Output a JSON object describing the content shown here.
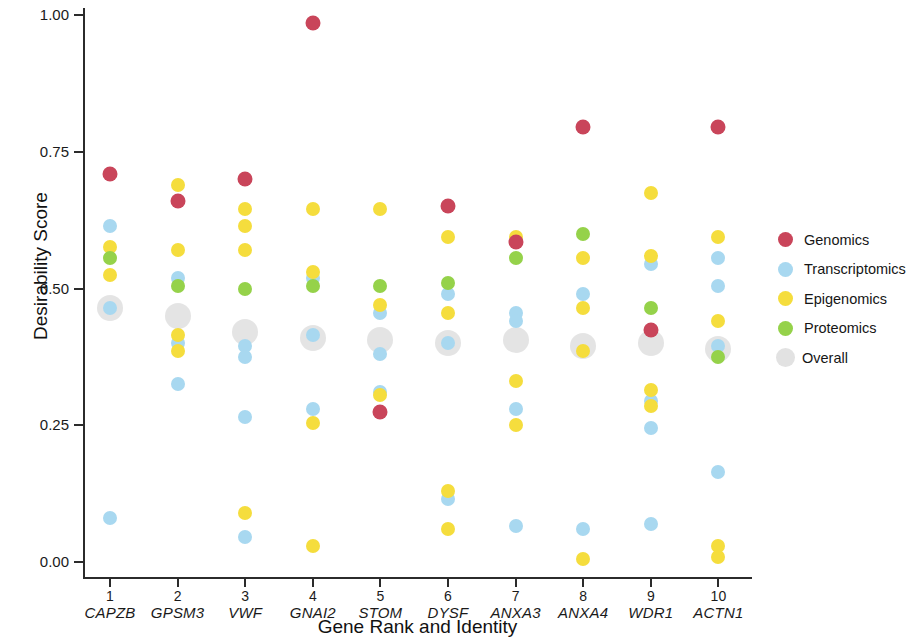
{
  "chart_data": {
    "type": "scatter",
    "title": "",
    "xlabel": "Gene Rank and Identity",
    "ylabel": "Desirability Score",
    "ylim": [
      0.0,
      1.0
    ],
    "ytick_labels": [
      "0.00",
      "0.25",
      "0.50",
      "0.75",
      "1.00"
    ],
    "ytick_values": [
      0.0,
      0.25,
      0.5,
      0.75,
      1.0
    ],
    "grid": false,
    "legend_position": "right",
    "categories": [
      {
        "rank": "1",
        "gene": "CAPZB"
      },
      {
        "rank": "2",
        "gene": "GPSM3"
      },
      {
        "rank": "3",
        "gene": "VWF"
      },
      {
        "rank": "4",
        "gene": "GNAI2"
      },
      {
        "rank": "5",
        "gene": "STOM"
      },
      {
        "rank": "6",
        "gene": "DYSF"
      },
      {
        "rank": "7",
        "gene": "ANXA3"
      },
      {
        "rank": "8",
        "gene": "ANXA4"
      },
      {
        "rank": "9",
        "gene": "WDR1"
      },
      {
        "rank": "10",
        "gene": "ACTN1"
      }
    ],
    "series": [
      {
        "name": "Genomics",
        "key": "genomics",
        "color": "#c9455a",
        "values": [
          0.71,
          0.66,
          0.7,
          0.985,
          0.275,
          0.65,
          0.585,
          0.795,
          0.425,
          0.795
        ]
      },
      {
        "name": "Transcriptomics",
        "key": "transcriptomics",
        "color": "#a8d8f0",
        "points": [
          {
            "cat": 1,
            "vals": [
              0.615,
              0.465,
              0.08
            ]
          },
          {
            "cat": 2,
            "vals": [
              0.52,
              0.4,
              0.325
            ]
          },
          {
            "cat": 3,
            "vals": [
              0.395,
              0.375,
              0.265,
              0.045
            ]
          },
          {
            "cat": 4,
            "vals": [
              0.52,
              0.415,
              0.28
            ]
          },
          {
            "cat": 5,
            "vals": [
              0.455,
              0.38,
              0.31
            ]
          },
          {
            "cat": 6,
            "vals": [
              0.49,
              0.4,
              0.115
            ]
          },
          {
            "cat": 7,
            "vals": [
              0.455,
              0.44,
              0.28,
              0.065
            ]
          },
          {
            "cat": 8,
            "vals": [
              0.49,
              0.06
            ]
          },
          {
            "cat": 9,
            "vals": [
              0.545,
              0.295,
              0.245,
              0.07
            ]
          },
          {
            "cat": 10,
            "vals": [
              0.555,
              0.505,
              0.395,
              0.165
            ]
          }
        ]
      },
      {
        "name": "Epigenomics",
        "key": "epigenomics",
        "color": "#f5dd3d",
        "points": [
          {
            "cat": 1,
            "vals": [
              0.575,
              0.525
            ]
          },
          {
            "cat": 2,
            "vals": [
              0.69,
              0.57,
              0.415,
              0.385
            ]
          },
          {
            "cat": 3,
            "vals": [
              0.645,
              0.615,
              0.57,
              0.09
            ]
          },
          {
            "cat": 4,
            "vals": [
              0.645,
              0.53,
              0.255,
              0.03
            ]
          },
          {
            "cat": 5,
            "vals": [
              0.645,
              0.47,
              0.305
            ]
          },
          {
            "cat": 6,
            "vals": [
              0.595,
              0.455,
              0.13,
              0.06
            ]
          },
          {
            "cat": 7,
            "vals": [
              0.595,
              0.33,
              0.25
            ]
          },
          {
            "cat": 8,
            "vals": [
              0.555,
              0.465,
              0.385,
              0.005
            ]
          },
          {
            "cat": 9,
            "vals": [
              0.675,
              0.56,
              0.315,
              0.285
            ]
          },
          {
            "cat": 10,
            "vals": [
              0.595,
              0.44,
              0.03,
              0.01
            ]
          }
        ]
      },
      {
        "name": "Proteomics",
        "key": "proteomics",
        "color": "#95d24a",
        "values": [
          0.555,
          0.505,
          0.5,
          0.505,
          0.505,
          0.51,
          0.555,
          0.6,
          0.465,
          0.375
        ]
      },
      {
        "name": "Overall",
        "key": "overall",
        "color": "#e2e2e2",
        "values": [
          0.465,
          0.45,
          0.42,
          0.41,
          0.405,
          0.4,
          0.405,
          0.395,
          0.4,
          0.39
        ]
      }
    ]
  },
  "legend": {
    "items": [
      {
        "label": "Genomics",
        "key": "genomics"
      },
      {
        "label": "Transcriptomics",
        "key": "transcriptomics"
      },
      {
        "label": "Epigenomics",
        "key": "epigenomics"
      },
      {
        "label": "Proteomics",
        "key": "proteomics"
      },
      {
        "label": "Overall",
        "key": "overall"
      }
    ]
  }
}
